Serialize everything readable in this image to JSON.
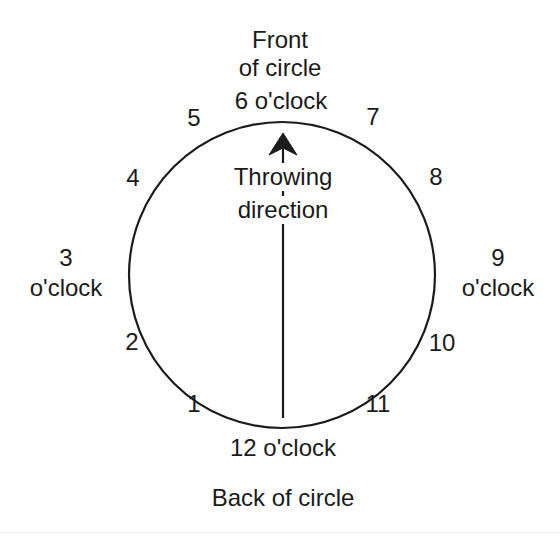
{
  "diagram": {
    "title_top": [
      "Front",
      "of circle",
      "6 o'clock"
    ],
    "front_line1": "Front",
    "front_line2": "of circle",
    "front_oclock": "6 o'clock",
    "back_oclock": "12 o'clock",
    "back_label": "Back of circle",
    "left_num": "3",
    "left_oclock": "o'clock",
    "right_num": "9",
    "right_oclock": "o'clock",
    "throwing_line1": "Throwing",
    "throwing_line2": "direction",
    "clock_numbers": [
      {
        "label": "1",
        "x": 194,
        "y": 412
      },
      {
        "label": "2",
        "x": 132,
        "y": 350
      },
      {
        "label": "4",
        "x": 133,
        "y": 186
      },
      {
        "label": "5",
        "x": 194,
        "y": 126
      },
      {
        "label": "7",
        "x": 373,
        "y": 125
      },
      {
        "label": "8",
        "x": 436,
        "y": 185
      },
      {
        "label": "10",
        "x": 442,
        "y": 351
      },
      {
        "label": "11",
        "x": 378,
        "y": 412
      }
    ],
    "circle": {
      "cx": 282,
      "cy": 275,
      "r": 153,
      "stroke": "#1b1b1b",
      "stroke_width": 2.2,
      "fill": "none"
    },
    "arrow": {
      "x": 283,
      "tip_y": 133,
      "tail_y": 418,
      "color": "#1b1b1b"
    },
    "colors": {
      "background": "#ffffff",
      "ink": "#1b1b1b",
      "rule": "#ececec"
    }
  }
}
